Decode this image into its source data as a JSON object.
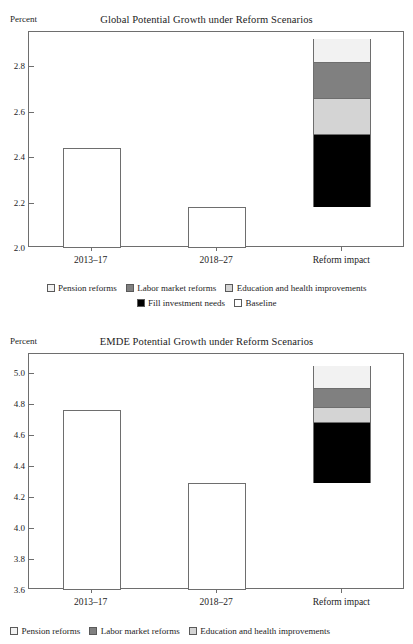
{
  "figure": {
    "axis_unit_label": "Percent"
  },
  "legend": {
    "items": [
      {
        "label": "Pension reforms",
        "color": "#f2f2f2"
      },
      {
        "label": "Labor market reforms",
        "color": "#808080"
      },
      {
        "label": "Education and health improvements",
        "color": "#d4d4d4"
      },
      {
        "label": "Fill investment needs",
        "color": "#000000"
      },
      {
        "label": "Baseline",
        "color": "#ffffff"
      }
    ]
  },
  "chart_data": [
    {
      "type": "bar",
      "title": "Global Potential Growth under Reform Scenarios",
      "xlabel": "",
      "ylabel": "Percent",
      "ylim": [
        2.0,
        2.95
      ],
      "yticks": [
        "2.0",
        "2.2",
        "2.4",
        "2.6",
        "2.8"
      ],
      "ytick_values": [
        2.0,
        2.2,
        2.4,
        2.6,
        2.8
      ],
      "grid": false,
      "legend_position": "below",
      "categories": [
        "2013–17",
        "2018–27",
        "Reform impact"
      ],
      "values": [
        2.44,
        2.18,
        2.92
      ],
      "series": [
        {
          "name": "Baseline",
          "color": "#ffffff",
          "values": [
            2.44,
            2.18,
            null
          ]
        },
        {
          "name": "Fill investment needs",
          "color": "#000000",
          "stack_from": 2.18,
          "stack_to": 2.5
        },
        {
          "name": "Education and health improvements",
          "color": "#d4d4d4",
          "stack_from": 2.5,
          "stack_to": 2.66
        },
        {
          "name": "Labor market reforms",
          "color": "#808080",
          "stack_from": 2.66,
          "stack_to": 2.82
        },
        {
          "name": "Pension reforms",
          "color": "#f2f2f2",
          "stack_from": 2.82,
          "stack_to": 2.92
        }
      ]
    },
    {
      "type": "bar",
      "title": "EMDE Potential Growth under Reform Scenarios",
      "xlabel": "",
      "ylabel": "Percent",
      "ylim": [
        3.6,
        5.12
      ],
      "yticks": [
        "3.6",
        "3.8",
        "4.0",
        "4.2",
        "4.4",
        "4.6",
        "4.8",
        "5.0"
      ],
      "ytick_values": [
        3.6,
        3.8,
        4.0,
        4.2,
        4.4,
        4.6,
        4.8,
        5.0
      ],
      "grid": false,
      "legend_position": "below",
      "categories": [
        "2013–17",
        "2018–27",
        "Reform impact"
      ],
      "values": [
        4.76,
        4.29,
        5.04
      ],
      "series": [
        {
          "name": "Baseline",
          "color": "#ffffff",
          "values": [
            4.76,
            4.29,
            null
          ]
        },
        {
          "name": "Fill investment needs",
          "color": "#000000",
          "stack_from": 4.29,
          "stack_to": 4.685
        },
        {
          "name": "Education and health improvements",
          "color": "#d4d4d4",
          "stack_from": 4.685,
          "stack_to": 4.78
        },
        {
          "name": "Labor market reforms",
          "color": "#808080",
          "stack_from": 4.78,
          "stack_to": 4.9
        },
        {
          "name": "Pension reforms",
          "color": "#f2f2f2",
          "stack_from": 4.9,
          "stack_to": 5.04
        }
      ]
    }
  ]
}
